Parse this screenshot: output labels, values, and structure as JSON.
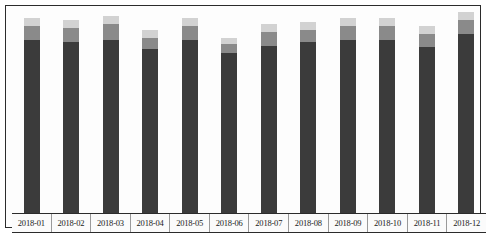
{
  "chart": {
    "title": "",
    "frame_color": "#2b2b2b",
    "background": "#ffffff"
  },
  "chart_data": {
    "type": "bar",
    "subtype": "stacked",
    "title": "",
    "xlabel": "",
    "ylabel": "",
    "grid": false,
    "legend_position": "none",
    "ylim": [
      0,
      100
    ],
    "categories": [
      "2018-01",
      "2018-02",
      "2018-03",
      "2018-04",
      "2018-05",
      "2018-06",
      "2018-07",
      "2018-08",
      "2018-09",
      "2018-10",
      "2018-11",
      "2018-12"
    ],
    "series": [
      {
        "name": "lower",
        "color": "#3b3b3b",
        "values": [
          88,
          87,
          88,
          83,
          88,
          81,
          85,
          87,
          88,
          88,
          84,
          91
        ]
      },
      {
        "name": "middle",
        "color": "#8a8a8a",
        "values": [
          7,
          7,
          8,
          6,
          7,
          5,
          7,
          6,
          7,
          7,
          7,
          7
        ]
      },
      {
        "name": "upper",
        "color": "#d2d2d2",
        "values": [
          4,
          4,
          4,
          4,
          4,
          3,
          4,
          4,
          4,
          4,
          4,
          4
        ]
      }
    ],
    "totals": [
      99,
      98,
      100,
      93,
      99,
      89,
      96,
      97,
      99,
      99,
      95,
      102
    ],
    "tick_labels": [
      "2018-01",
      "2018-02",
      "2018-03",
      "2018-04",
      "2018-05",
      "2018-06",
      "2018-07",
      "2018-08",
      "2018-09",
      "2018-10",
      "2018-11",
      "2018-12"
    ]
  }
}
